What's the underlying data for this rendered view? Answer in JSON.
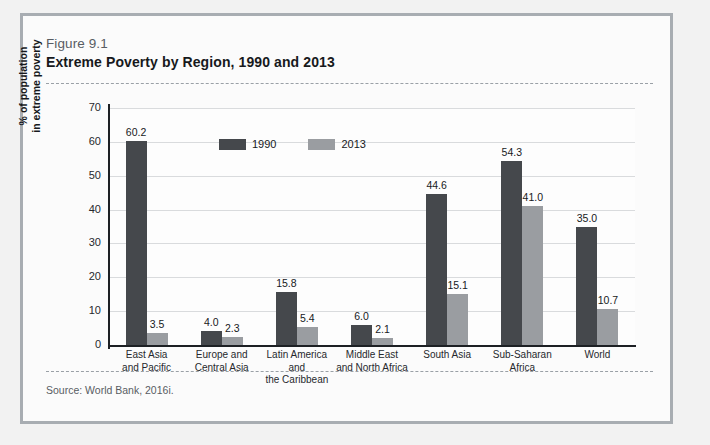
{
  "figure": {
    "number": "Figure 9.1",
    "title": "Extreme Poverty by Region, 1990 and 2013",
    "source": "Source: World Bank, 2016i."
  },
  "colors": {
    "series_1990": "#45484c",
    "series_2013": "#9a9da1",
    "frame_border": "#a8adb2",
    "axis": "#1d2024",
    "gridline": "#d9dbdd"
  },
  "chart_data": {
    "type": "bar",
    "title": "Extreme Poverty by Region, 1990 and 2013",
    "xlabel": "",
    "ylabel": "% of population in extreme poverty",
    "ylim": [
      0,
      70
    ],
    "yticks": [
      0,
      10,
      20,
      30,
      40,
      50,
      60,
      70
    ],
    "grid": true,
    "legend_position": "top-center",
    "categories": [
      "East Asia and Pacific",
      "Europe and Central Asia",
      "Latin America and the Caribbean",
      "Middle East and North Africa",
      "South Asia",
      "Sub-Saharan Africa",
      "World"
    ],
    "category_lines": [
      [
        "East Asia",
        "and Pacific"
      ],
      [
        "Europe and",
        "Central Asia"
      ],
      [
        "Latin America and",
        "the Caribbean"
      ],
      [
        "Middle East",
        "and North Africa"
      ],
      [
        "South Asia",
        ""
      ],
      [
        "Sub-Saharan",
        "Africa"
      ],
      [
        "World",
        ""
      ]
    ],
    "series": [
      {
        "name": "1990",
        "values": [
          60.2,
          4.0,
          15.8,
          6.0,
          44.6,
          54.3,
          35.0
        ]
      },
      {
        "name": "2013",
        "values": [
          3.5,
          2.3,
          5.4,
          2.1,
          15.1,
          41.0,
          10.7
        ]
      }
    ]
  },
  "axis": {
    "y_title_line1": "% of population",
    "y_title_line2": "in extreme poverty"
  }
}
